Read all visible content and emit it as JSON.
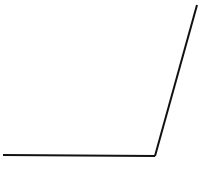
{
  "diagram": {
    "type": "angle",
    "background": "#ffffff",
    "stroke_color": "#111111",
    "stroke_width": 2,
    "vertex": {
      "x": 155,
      "y": 156
    },
    "ray_horizontal_end": {
      "x": 3,
      "y": 155
    },
    "ray_oblique_end": {
      "x": 197,
      "y": 5
    }
  }
}
